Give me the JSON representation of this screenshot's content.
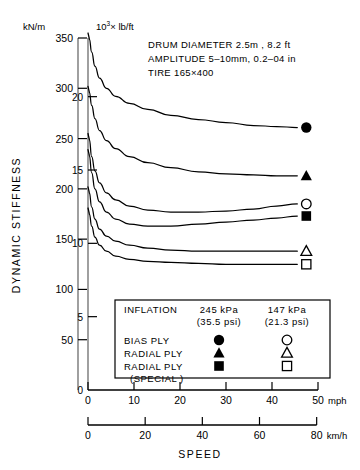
{
  "figure": {
    "axis_unit_left": "kN/m",
    "axis_unit_right_pre": "10",
    "axis_unit_right_sup": "3",
    "axis_unit_right_post": "× lb/ft",
    "y_axis_title": "DYNAMIC   STIFFNESS",
    "x_axis_title": "SPEED",
    "x_unit_top": "mph",
    "x_unit_bottom": "km/h"
  },
  "annotations": [
    "DRUM  DIAMETER  2.5m ,  8.2 ft",
    "AMPLITUDE  5–10mm,   0.2–04 in",
    "TIRE  165×400"
  ],
  "legend": {
    "title": "INFLATION",
    "col1_value": "245 kPa",
    "col1_sub": "(35.5 psi)",
    "col2_value": "147 kPa",
    "col2_sub": "(21.3 psi)",
    "rows": [
      {
        "label": "BIAS  PLY",
        "label2": "",
        "marker_filled": "filled-circle",
        "marker_open": "open-circle"
      },
      {
        "label": "RADIAL  PLY",
        "label2": "",
        "marker_filled": "filled-triangle",
        "marker_open": "open-triangle"
      },
      {
        "label": "RADIAL  PLY",
        "label2": "(SPECIAL )",
        "marker_filled": "filled-square",
        "marker_open": "open-square"
      }
    ]
  },
  "chart_data": {
    "type": "line",
    "xlabel": "SPEED",
    "ylabel": "DYNAMIC STIFFNESS",
    "grid": false,
    "legend_position": "inside-bottom",
    "axes": {
      "y_left": {
        "label": "kN/m",
        "ticks": [
          50,
          100,
          150,
          200,
          250,
          300,
          350
        ],
        "lim": [
          0,
          350
        ]
      },
      "y_right": {
        "label": "10^3 x lb/ft",
        "ticks": [
          5,
          10,
          15,
          20
        ],
        "lim": [
          0,
          24
        ]
      },
      "x_top": {
        "label": "mph",
        "ticks": [
          0,
          10,
          20,
          30,
          40,
          50
        ],
        "lim": [
          0,
          50
        ]
      },
      "x_bottom": {
        "label": "km/h",
        "ticks": [
          0,
          20,
          40,
          60,
          80
        ],
        "lim": [
          0,
          80
        ]
      }
    },
    "series": [
      {
        "name": "BIAS PLY 245 kPa",
        "marker": "filled-circle",
        "end_marker_value": {
          "x_mph": 45.5,
          "y_kN_m": 261
        },
        "x_mph": [
          0.3,
          0.8,
          1.5,
          2.5,
          4,
          6,
          9,
          13,
          18,
          24,
          30,
          36,
          41,
          45.5
        ],
        "y_kN_m": [
          349,
          336,
          322,
          310,
          300,
          292,
          285,
          279,
          273,
          269,
          266,
          263,
          262,
          261
        ]
      },
      {
        "name": "RADIAL PLY 245 kPa",
        "marker": "filled-triangle",
        "end_marker_value": {
          "x_mph": 45.5,
          "y_kN_m": 213
        },
        "x_mph": [
          0.3,
          0.8,
          1.5,
          2.5,
          4,
          6,
          9,
          13,
          18,
          24,
          30,
          36,
          41,
          45.5
        ],
        "y_kN_m": [
          296,
          283,
          270,
          258,
          248,
          240,
          232,
          226,
          221,
          217,
          215,
          214,
          213,
          213
        ]
      },
      {
        "name": "BIAS PLY 147 kPa",
        "marker": "open-circle",
        "end_marker_value": {
          "x_mph": 45.5,
          "y_kN_m": 185
        },
        "x_mph": [
          0.3,
          0.8,
          1.5,
          2.5,
          4,
          6,
          9,
          13,
          18,
          24,
          30,
          36,
          41,
          45.5
        ],
        "y_kN_m": [
          249,
          232,
          218,
          206,
          196,
          189,
          183,
          179,
          177,
          177,
          178,
          180,
          183,
          185
        ]
      },
      {
        "name": "RADIAL PLY (SPECIAL) 245 kPa",
        "marker": "filled-square",
        "end_marker_value": {
          "x_mph": 45.5,
          "y_kN_m": 173
        },
        "x_mph": [
          0.3,
          0.8,
          1.5,
          2.5,
          4,
          6,
          9,
          13,
          18,
          24,
          30,
          36,
          41,
          45.5
        ],
        "y_kN_m": [
          233,
          216,
          200,
          187,
          177,
          170,
          165,
          163,
          163,
          165,
          167,
          169,
          171,
          173
        ]
      },
      {
        "name": "RADIAL PLY 147 kPa",
        "marker": "open-triangle",
        "end_marker_value": {
          "x_mph": 45.5,
          "y_kN_m": 138
        },
        "x_mph": [
          0.3,
          0.8,
          1.5,
          2.5,
          4,
          6,
          9,
          13,
          18,
          24,
          30,
          36,
          41,
          45.5
        ],
        "y_kN_m": [
          196,
          182,
          170,
          160,
          153,
          148,
          144,
          141,
          139,
          138,
          138,
          138,
          138,
          138
        ]
      },
      {
        "name": "RADIAL PLY (SPECIAL) 147 kPa",
        "marker": "open-square",
        "end_marker_value": {
          "x_mph": 45.5,
          "y_kN_m": 125
        },
        "x_mph": [
          0.3,
          0.8,
          1.5,
          2.5,
          4,
          6,
          9,
          13,
          18,
          24,
          30,
          36,
          41,
          45.5
        ],
        "y_kN_m": [
          175,
          163,
          152,
          144,
          138,
          133,
          130,
          128,
          127,
          126,
          125,
          125,
          125,
          125
        ]
      }
    ]
  }
}
